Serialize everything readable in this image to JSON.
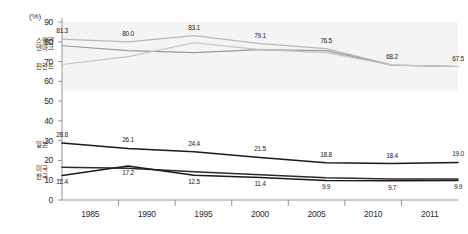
{
  "chart_data": {
    "type": "line",
    "title": "",
    "xlabel": "",
    "ylabel": "",
    "unit_label": "(%)",
    "categories": [
      "1985",
      "1990",
      "1995",
      "2000",
      "2005",
      "2010",
      "2011"
    ],
    "ylim": [
      0,
      90
    ],
    "yticks": [
      "0",
      "10",
      "20",
      "30",
      "40",
      "50",
      "60",
      "70",
      "80",
      "90"
    ],
    "grid": false,
    "legend": "inline-left",
    "series": [
      {
        "name": "스웨덴",
        "color": "#b8b8b8",
        "values": [
          81.3,
          80.0,
          83.1,
          79.1,
          76.5,
          68.2,
          67.5
        ],
        "labels": [
          "81.3",
          "80.0",
          "83.1",
          "79.1",
          "76.5",
          "68.2",
          "67.5"
        ],
        "label_position": "above"
      },
      {
        "name": "덴마크",
        "color": "#9a9a9a",
        "values": [
          78.0,
          75.5,
          74.5,
          76.0,
          75.5,
          68.2,
          67.5
        ],
        "labels": [],
        "label_position": "none"
      },
      {
        "name": "핀란드",
        "color": "#c4c4c4",
        "values": [
          68.5,
          72.5,
          79.5,
          76.0,
          74.5,
          68.2,
          67.5
        ],
        "labels": [],
        "label_position": "none"
      },
      {
        "name": "일본",
        "color": "#1a1a1a",
        "values": [
          28.8,
          26.1,
          24.4,
          21.5,
          18.8,
          18.4,
          19.0
        ],
        "labels": [
          "28.8",
          "26.1",
          "24.4",
          "21.5",
          "18.8",
          "18.4",
          "19.0"
        ],
        "label_position": "above"
      },
      {
        "name": "미국",
        "color": "#2b2b2b",
        "values": [
          16.5,
          16.0,
          14.3,
          12.8,
          11.2,
          10.6,
          10.6
        ],
        "labels": [],
        "label_position": "none"
      },
      {
        "name": "한국",
        "color": "#1a1a1a",
        "values": [
          12.4,
          17.2,
          12.5,
          11.4,
          9.9,
          9.7,
          9.9
        ],
        "labels": [
          "12.4",
          "17.2",
          "12.5",
          "11.4",
          "9.9",
          "9.7",
          "9.9"
        ],
        "label_position": "below"
      }
    ]
  }
}
